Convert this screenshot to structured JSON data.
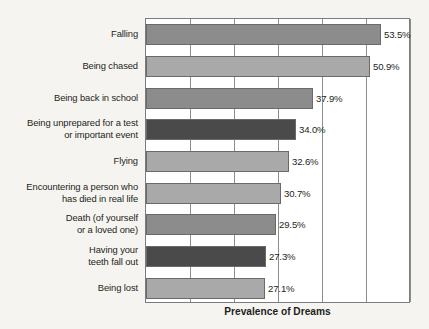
{
  "chart_data": {
    "type": "bar",
    "orientation": "horizontal",
    "title": "",
    "xlabel": "Prevalence of Dreams",
    "ylabel": "",
    "categories": [
      "Falling",
      "Being chased",
      "Being back in school",
      "Being unprepared for a test\nor important event",
      "Flying",
      "Encountering a person who\nhas died in real life",
      "Death (of yourself\nor a loved one)",
      "Having your\nteeth fall out",
      "Being lost"
    ],
    "values": [
      53.5,
      50.9,
      37.9,
      34.0,
      32.6,
      30.7,
      29.5,
      27.3,
      27.1
    ],
    "value_labels": [
      "53.5%",
      "50.9%",
      "37.9%",
      "34.0%",
      "32.6%",
      "30.7%",
      "29.5%",
      "27.3%",
      "27.1%"
    ],
    "bar_colors": [
      "#8c8c8c",
      "#a9a9a9",
      "#8c8c8c",
      "#4a4a4a",
      "#a9a9a9",
      "#a9a9a9",
      "#8c8c8c",
      "#4a4a4a",
      "#a9a9a9"
    ],
    "xlim": [
      0,
      60
    ],
    "xticks": [
      0,
      10,
      20,
      30,
      40,
      50,
      60
    ],
    "grid": true,
    "legend": "none",
    "bar_outline_color": "#6a6a6a",
    "plot_background": "#ffffff",
    "page_background": "#f6f4f0"
  },
  "axis": {
    "title": "Prevalence of Dreams"
  }
}
